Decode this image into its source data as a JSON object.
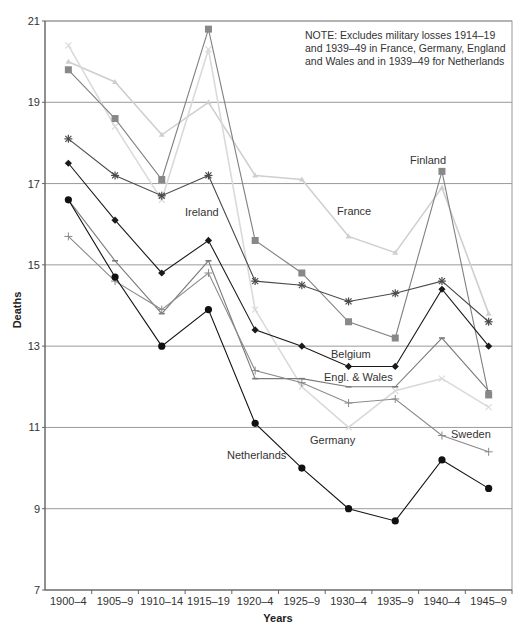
{
  "chart_data": {
    "type": "line",
    "title": "",
    "xlabel": "Years",
    "ylabel": "Deaths",
    "ylim": [
      7,
      21
    ],
    "yticks": [
      7,
      9,
      11,
      13,
      15,
      17,
      19,
      21
    ],
    "grid": "horizontal",
    "legend": "inline labels",
    "note": [
      "NOTE: Excludes military losses 1914–19",
      "and 1939–49 in France, Germany, England",
      "and Wales and in 1939–49  for Netherlands"
    ],
    "categories": [
      "1900–4",
      "1905–9",
      "1910–14",
      "1915–19",
      "1920–4",
      "1925–9",
      "1930–4",
      "1935–9",
      "1940–4",
      "1945–9"
    ],
    "series": [
      {
        "name": "France",
        "marker": "triangle",
        "color": "#cfcfcf",
        "values": [
          20.0,
          19.5,
          18.2,
          19.0,
          17.2,
          17.1,
          15.7,
          15.3,
          16.9,
          13.8
        ]
      },
      {
        "name": "Germany",
        "marker": "x",
        "color": "#dadada",
        "values": [
          20.4,
          18.4,
          16.6,
          20.3,
          13.9,
          12.0,
          11.0,
          11.9,
          12.2,
          11.5
        ]
      },
      {
        "name": "Finland",
        "marker": "square",
        "color": "#808080",
        "values": [
          19.8,
          18.6,
          17.1,
          20.8,
          15.6,
          14.8,
          13.6,
          13.2,
          17.3,
          11.8
        ]
      },
      {
        "name": "Ireland",
        "marker": "asterisk",
        "color": "#4a4a4a",
        "values": [
          18.1,
          17.2,
          16.7,
          17.2,
          14.6,
          14.5,
          14.1,
          14.3,
          14.6,
          13.6
        ]
      },
      {
        "name": "Belgium",
        "marker": "diamond",
        "color": "#1a1a1a",
        "values": [
          17.5,
          16.1,
          14.8,
          15.6,
          13.4,
          13.0,
          12.5,
          12.5,
          14.4,
          13.0
        ]
      },
      {
        "name": "Engl. & Wales",
        "marker": "dash",
        "color": "#7a7a7a",
        "values": [
          16.6,
          15.1,
          13.8,
          15.1,
          12.2,
          12.2,
          12.0,
          12.0,
          13.2,
          11.9
        ]
      },
      {
        "name": "Sweden",
        "marker": "plus",
        "color": "#8a8a8a",
        "values": [
          15.7,
          14.6,
          13.9,
          14.8,
          12.4,
          12.1,
          11.6,
          11.7,
          10.8,
          10.4
        ]
      },
      {
        "name": "Netherlands",
        "marker": "circle",
        "color": "#111111",
        "values": [
          16.6,
          14.7,
          13.0,
          13.9,
          11.1,
          10.0,
          9.0,
          8.7,
          10.2,
          9.5
        ]
      }
    ],
    "labels": [
      {
        "text": "Finland",
        "x": 410,
        "y": 164
      },
      {
        "text": "France",
        "x": 337,
        "y": 215
      },
      {
        "text": "Ireland",
        "x": 185,
        "y": 216
      },
      {
        "text": "Belgium",
        "x": 331,
        "y": 358
      },
      {
        "text": "Engl. & Wales",
        "x": 324,
        "y": 381
      },
      {
        "text": "Germany",
        "x": 310,
        "y": 444
      },
      {
        "text": "Netherlands",
        "x": 227,
        "y": 459
      },
      {
        "text": "Sweden",
        "x": 451,
        "y": 438
      }
    ]
  }
}
